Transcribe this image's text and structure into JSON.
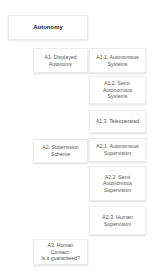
{
  "diagram": {
    "root": {
      "label": "Autonomy"
    },
    "groups": [
      {
        "label": "A1. Displayed\nAutonomy",
        "children": [
          {
            "label": "A1.1. Autonomous\nSystems"
          },
          {
            "label": "A1.2. Semi-\nAutonomous\nSystems"
          },
          {
            "label": "A1.3. Teleoperated"
          }
        ]
      },
      {
        "label": "A2. Supervision\nScheme",
        "children": [
          {
            "label": "A2.1. Autonomous\nSupervision"
          },
          {
            "label": "A2.2. Semi\nAutonomous\nSupervision"
          },
          {
            "label": "A2.3. Human\nSupervision"
          }
        ]
      },
      {
        "label": "A3. Human\nContact:\nIs it guaranteed?",
        "children": []
      }
    ]
  }
}
